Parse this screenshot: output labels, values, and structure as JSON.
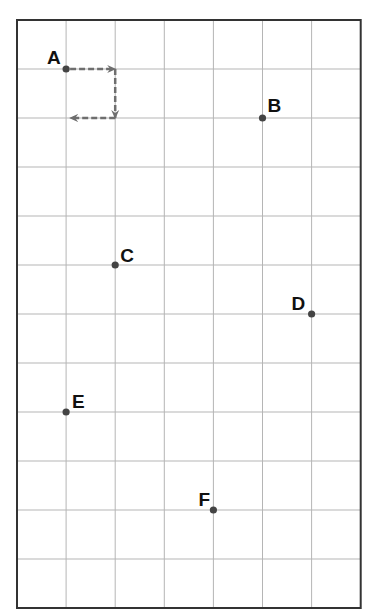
{
  "grid": {
    "columns": 7,
    "rows": 12,
    "origin_x": 17,
    "origin_y": 20,
    "cell_w": 49.1,
    "cell_h": 49.0,
    "line_color": "#b5b5b5",
    "border_color": "#333333"
  },
  "points": [
    {
      "label": "A",
      "col": 1,
      "row": 1,
      "label_dx": -19,
      "label_dy": -5
    },
    {
      "label": "B",
      "col": 5,
      "row": 2,
      "label_dx": 5,
      "label_dy": -6
    },
    {
      "label": "C",
      "col": 2,
      "row": 5,
      "label_dx": 5,
      "label_dy": -3
    },
    {
      "label": "D",
      "col": 6,
      "row": 6,
      "label_dx": -20,
      "label_dy": -4
    },
    {
      "label": "E",
      "col": 1,
      "row": 8,
      "label_dx": 6,
      "label_dy": -4
    },
    {
      "label": "F",
      "col": 4,
      "row": 10,
      "label_dx": -15,
      "label_dy": -4
    }
  ],
  "point_color": "#444444",
  "arrow_path": {
    "color": "#6e6e6e",
    "segments": [
      {
        "from": [
          1,
          1
        ],
        "to": [
          2,
          1
        ]
      },
      {
        "from": [
          2,
          1
        ],
        "to": [
          2,
          2
        ]
      },
      {
        "from": [
          2,
          2
        ],
        "to": [
          1,
          2
        ]
      }
    ]
  }
}
